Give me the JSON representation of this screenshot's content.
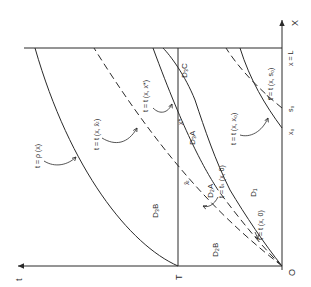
{
  "diagram": {
    "axes": {
      "x_axis_label": "X",
      "t_axis_label": "t",
      "origin_label": "O",
      "x_end_label": "x = L",
      "t_mark_label": "T"
    },
    "points": {
      "x0": "x₀",
      "s0": "s₀",
      "x_star": "x*",
      "x_bar_T": "x̄ₜ"
    },
    "domains": {
      "D1": "D₁",
      "D2A": "D₂A",
      "D2B": "D₂B",
      "D3A": "D₃A",
      "D3B": "D₃B",
      "D3C": "D₃C"
    },
    "curves": {
      "rho": "t = ρ (x)",
      "t_xbarT": "t = t (x, x̄ₜ)",
      "t_xstar": "t = t (x, x*)",
      "t_x0": "t = t (x, x₀)",
      "t_s0": "t = t (x, s₀)",
      "ts_x0": "t = tₛ (x, 0)",
      "t_x_0": "t = t (x, 0)"
    }
  }
}
